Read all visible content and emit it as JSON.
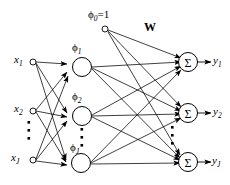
{
  "diagram": {
    "colors": {
      "stroke": "#000000",
      "background": "#ffffff",
      "text": "#000000"
    },
    "bias": {
      "label_phi": "ϕ",
      "label_sub": "0",
      "label_eq": "=1",
      "full": "ϕ₀=1"
    },
    "weight_label": "W",
    "input_layer": {
      "nodes": [
        {
          "name": "x1",
          "base": "x",
          "sub": "1",
          "sub2": ""
        },
        {
          "name": "x2",
          "base": "x",
          "sub": "2",
          "sub2": ""
        },
        {
          "name": "xJ1",
          "base": "x",
          "sub": "J",
          "sub2": "1"
        }
      ],
      "ellipsis": "⋮"
    },
    "hidden_layer": {
      "nodes": [
        {
          "name": "phi1",
          "base": "ϕ",
          "sub": "1",
          "sub2": ""
        },
        {
          "name": "phi2",
          "base": "ϕ",
          "sub": "2",
          "sub2": ""
        },
        {
          "name": "phiJ2",
          "base": "ϕ",
          "sub": "J",
          "sub2": "2"
        }
      ],
      "ellipsis": "⋮"
    },
    "output_layer": {
      "node_glyph": "Σ",
      "nodes": [
        {
          "name": "y1",
          "base": "y",
          "sub": "1",
          "sub2": ""
        },
        {
          "name": "y2",
          "base": "y",
          "sub": "2",
          "sub2": ""
        },
        {
          "name": "yJ3",
          "base": "y",
          "sub": "J",
          "sub2": "3"
        }
      ],
      "ellipsis": "⋮"
    }
  }
}
